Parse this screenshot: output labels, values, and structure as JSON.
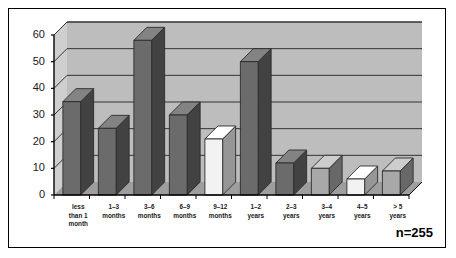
{
  "chart_data": {
    "type": "bar",
    "title": "",
    "subtitle": "",
    "xlabel": "",
    "ylabel": "",
    "ylim": [
      0,
      60
    ],
    "ytick_values": [
      0,
      10,
      20,
      30,
      40,
      50,
      60
    ],
    "ytick_labels": [
      "0",
      "10",
      "20",
      "30",
      "40",
      "50",
      "60"
    ],
    "grid": true,
    "grid_axis": "y",
    "legend": "none",
    "style": "3d-column",
    "annotations": [
      {
        "name": "sample-size",
        "text": "n=255"
      }
    ],
    "categories": [
      "less than 1 month",
      "1–3 months",
      "3–6 months",
      "6–9 months",
      "9–12 months",
      "1–2 years",
      "2–3 years",
      "3–4 years",
      "4–5 years",
      "> 5 years"
    ],
    "category_label_lines": [
      [
        "less",
        "than 1",
        "month"
      ],
      [
        "1–3",
        "months"
      ],
      [
        "3–6",
        "months"
      ],
      [
        "6–9",
        "months"
      ],
      [
        "9–12",
        "months"
      ],
      [
        "1–2",
        "years"
      ],
      [
        "2–3",
        "years"
      ],
      [
        "3–4",
        "years"
      ],
      [
        "4–5",
        "years"
      ],
      [
        "> 5",
        "years"
      ]
    ],
    "values": [
      35,
      25,
      58,
      30,
      21,
      50,
      12,
      10,
      6,
      9
    ],
    "bar_colors": [
      "#6b6b6b",
      "#6b6b6b",
      "#6b6b6b",
      "#6b6b6b",
      "#f2f2f2",
      "#6b6b6b",
      "#6b6b6b",
      "#a8a8a8",
      "#f2f2f2",
      "#a8a8a8"
    ]
  },
  "colors": {
    "frame_border": "#000000",
    "page_background": "#ffffff",
    "plot_background": "#bdbdbd",
    "wall_side": "#cfcfcf",
    "floor": "#9e9e9e",
    "gridline": "#333333",
    "axis": "#000000",
    "bar_dark": "#6b6b6b",
    "bar_mid": "#a8a8a8",
    "bar_light": "#f2f2f2",
    "text": "#1a1a1a"
  }
}
